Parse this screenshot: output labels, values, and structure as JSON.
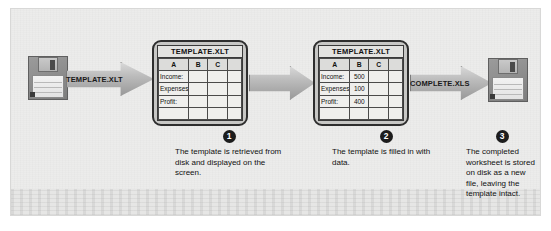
{
  "figure": {
    "background_color": "#ececeb"
  },
  "source_disk": {
    "name": "source-floppy-disk",
    "icon": "floppy-disk-icon"
  },
  "target_disk": {
    "name": "target-floppy-disk",
    "icon": "floppy-disk-icon"
  },
  "arrows": [
    {
      "label": "TEMPLATE.XLT",
      "icon": "right-arrow-icon"
    },
    {
      "label": "",
      "icon": "right-arrow-icon"
    },
    {
      "label": "COMPLETE.XLS",
      "icon": "right-arrow-icon"
    }
  ],
  "screens": [
    {
      "title": "TEMPLATE.XLT",
      "columns": [
        "A",
        "B",
        "C",
        ""
      ],
      "rows": [
        {
          "label": "Income:",
          "b": "",
          "c": "",
          "d": ""
        },
        {
          "label": "Expenses:",
          "b": "",
          "c": "",
          "d": ""
        },
        {
          "label": "Profit:",
          "b": "",
          "c": "",
          "d": ""
        },
        {
          "label": "",
          "b": "",
          "c": "",
          "d": ""
        }
      ]
    },
    {
      "title": "TEMPLATE.XLT",
      "columns": [
        "A",
        "B",
        "C",
        ""
      ],
      "rows": [
        {
          "label": "Income:",
          "b": "500",
          "c": "",
          "d": ""
        },
        {
          "label": "Expenses:",
          "b": "100",
          "c": "",
          "d": ""
        },
        {
          "label": "Profit:",
          "b": "400",
          "c": "",
          "d": ""
        },
        {
          "label": "",
          "b": "",
          "c": "",
          "d": ""
        }
      ]
    }
  ],
  "steps": [
    {
      "number": "1",
      "text": "The template is retrieved from disk and displayed on the screen."
    },
    {
      "number": "2",
      "text": "The template is filled in with data."
    },
    {
      "number": "3",
      "text": "The completed worksheet is stored on disk as a new file, leaving the template intact."
    }
  ]
}
